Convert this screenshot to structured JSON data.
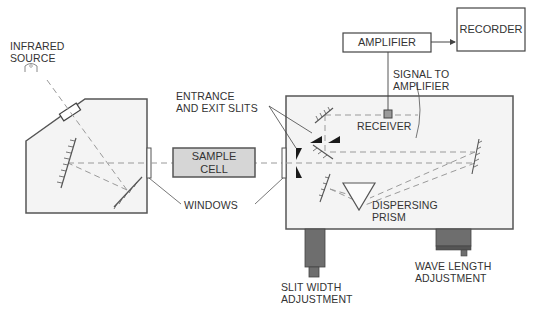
{
  "diagram": {
    "labels": {
      "infrared_source": [
        "INFRARED",
        "SOURCE"
      ],
      "entrance_exit_slits": [
        "ENTRANCE",
        "AND EXIT SLITS"
      ],
      "sample_cell": [
        "SAMPLE",
        "CELL"
      ],
      "windows": "WINDOWS",
      "amplifier": "AMPLIFIER",
      "recorder": "RECORDER",
      "signal_to_amplifier": [
        "SIGNAL TO",
        "AMPLIFIER"
      ],
      "receiver": "RECEIVER",
      "dispersing_prism": [
        "DISPERSING",
        "PRISM"
      ],
      "slit_width_adjustment": [
        "SLIT WIDTH",
        "ADJUSTMENT"
      ],
      "wave_length_adjustment": [
        "WAVE LENGTH",
        "ADJUSTMENT"
      ]
    },
    "colors": {
      "housing_fill": "#f4f4f4",
      "outline": "#555555",
      "beam": "#999999",
      "sample_cell_fill": "#d6d6d6",
      "knob_fill": "#6e6e6e",
      "slit_fill": "#1a1a1a",
      "text": "#333333"
    }
  }
}
